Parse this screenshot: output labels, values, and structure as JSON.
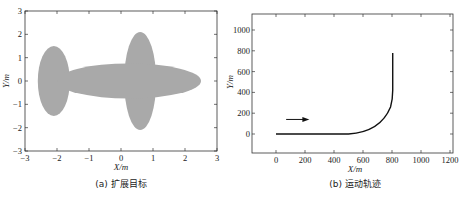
{
  "chart_data": [
    {
      "type": "area",
      "title": "",
      "caption": "(a) 扩展目标",
      "xlabel": "X/m",
      "ylabel": "Y/m",
      "xlim": [
        -3,
        3
      ],
      "ylim": [
        -3,
        3
      ],
      "xticks": [
        "-3",
        "-2",
        "-1",
        "0",
        "1",
        "2",
        "3"
      ],
      "yticks": [
        "3",
        "2",
        "1",
        "0",
        "-1",
        "-2",
        "-3"
      ],
      "grid": false,
      "shapes": [
        {
          "kind": "ellipse",
          "cx": -2.1,
          "cy": 0,
          "rx": 0.5,
          "ry": 1.5,
          "fill": "#a9a9a9"
        },
        {
          "kind": "ellipse",
          "cx": 0.6,
          "cy": 0,
          "rx": 0.5,
          "ry": 2.1,
          "fill": "#a9a9a9"
        },
        {
          "kind": "ellipse",
          "cx": 0.25,
          "cy": 0,
          "rx": 2.25,
          "ry": 0.75,
          "fill": "#a9a9a9"
        }
      ]
    },
    {
      "type": "line",
      "title": "",
      "caption": "(b) 运动轨迹",
      "xlabel": "X/m",
      "ylabel": "Y/m",
      "xlim": [
        -170,
        1220
      ],
      "ylim": [
        -180,
        1170
      ],
      "xticks": [
        "0",
        "200",
        "400",
        "600",
        "800",
        "1000",
        "1200"
      ],
      "yticks": [
        "1000",
        "800",
        "600",
        "400",
        "200",
        "0"
      ],
      "grid": false,
      "series": [
        {
          "name": "trajectory",
          "x": [
            0,
            500,
            560,
            620,
            680,
            730,
            770,
            795,
            805,
            805
          ],
          "y": [
            0,
            0,
            15,
            45,
            95,
            170,
            260,
            350,
            450,
            780
          ]
        }
      ],
      "annotations": [
        {
          "kind": "arrow",
          "from": [
            70,
            140
          ],
          "to": [
            230,
            140
          ],
          "text": ""
        }
      ]
    }
  ],
  "captions": {
    "left": "(a) 扩展目标",
    "right": "(b) 运动轨迹"
  },
  "labels": {
    "left_x": "X/m",
    "left_y": "Y/m",
    "right_x": "X/m",
    "right_y": "Y/m"
  }
}
